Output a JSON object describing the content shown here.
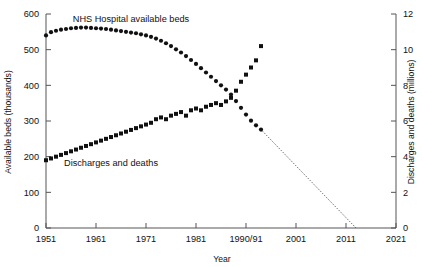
{
  "chart_data": {
    "type": "scatter",
    "title": "",
    "xlabel": "Year",
    "ylabel": "Available beds (thousands)",
    "y2label": "Discharges and deaths (millions)",
    "grid": false,
    "legend_position": "inline-annotations",
    "xlim": [
      1951,
      2021
    ],
    "ylim": [
      0,
      600
    ],
    "y2lim": [
      0,
      12
    ],
    "xticks": [
      1951,
      1961,
      1971,
      1981,
      1991,
      2001,
      2011,
      2021
    ],
    "xticklabels": [
      "1951",
      "1961",
      "1971",
      "1981",
      "1990/91",
      "2001",
      "2011",
      "2021"
    ],
    "yticks": [
      0,
      100,
      200,
      300,
      400,
      500,
      600
    ],
    "yticklabels": [
      "0",
      "100",
      "200",
      "300",
      "400",
      "500",
      "600"
    ],
    "y2ticks": [
      0,
      2,
      4,
      6,
      8,
      10,
      12
    ],
    "y2ticklabels": [
      "0",
      "2",
      "4",
      "6",
      "8",
      "10",
      "12"
    ],
    "annotations": [
      {
        "text": "NHS Hospital available beds",
        "x": 1968,
        "y": 585,
        "axis": "left"
      },
      {
        "text": "Discharges and deaths",
        "x": 1964,
        "y": 182,
        "axis": "left"
      }
    ],
    "series": [
      {
        "name": "NHS Hospital available beds",
        "axis": "left",
        "units": "thousands",
        "marker": "circle",
        "x": [
          1951,
          1952,
          1953,
          1954,
          1955,
          1956,
          1957,
          1958,
          1959,
          1960,
          1961,
          1962,
          1963,
          1964,
          1965,
          1966,
          1967,
          1968,
          1969,
          1970,
          1971,
          1972,
          1973,
          1974,
          1975,
          1976,
          1977,
          1978,
          1979,
          1980,
          1981,
          1982,
          1983,
          1984,
          1985,
          1986,
          1987,
          1988,
          1989,
          1990,
          1991,
          1992,
          1993,
          1994
        ],
        "y": [
          540,
          549,
          553,
          556,
          558,
          560,
          561,
          562,
          562,
          561,
          560,
          559,
          558,
          556,
          554,
          552,
          550,
          548,
          546,
          543,
          540,
          536,
          531,
          525,
          518,
          510,
          501,
          492,
          482,
          471,
          460,
          448,
          436,
          424,
          412,
          400,
          388,
          374,
          356,
          337,
          318,
          301,
          288,
          276
        ]
      },
      {
        "name": "Discharges and deaths",
        "axis": "right",
        "units": "millions",
        "marker": "square",
        "x": [
          1951,
          1952,
          1953,
          1954,
          1955,
          1956,
          1957,
          1958,
          1959,
          1960,
          1961,
          1962,
          1963,
          1964,
          1965,
          1966,
          1967,
          1968,
          1969,
          1970,
          1971,
          1972,
          1973,
          1974,
          1975,
          1976,
          1977,
          1978,
          1979,
          1980,
          1981,
          1982,
          1983,
          1984,
          1985,
          1986,
          1987,
          1988,
          1989,
          1990,
          1991,
          1992,
          1993,
          1994
        ],
        "y": [
          3.8,
          3.9,
          4.0,
          4.1,
          4.2,
          4.3,
          4.4,
          4.5,
          4.6,
          4.7,
          4.8,
          4.9,
          5.0,
          5.1,
          5.2,
          5.3,
          5.4,
          5.5,
          5.6,
          5.7,
          5.8,
          5.9,
          6.1,
          6.2,
          6.1,
          6.3,
          6.4,
          6.5,
          6.3,
          6.6,
          6.7,
          6.6,
          6.8,
          6.9,
          7.0,
          6.9,
          7.1,
          7.3,
          7.7,
          8.2,
          8.6,
          9.0,
          9.4,
          10.2
        ]
      },
      {
        "name": "Projection of available beds to zero",
        "axis": "left",
        "units": "thousands",
        "marker": "none",
        "linestyle": "dotted",
        "x": [
          1994,
          2013
        ],
        "y": [
          276,
          0
        ]
      }
    ]
  },
  "colors": {
    "marker": "#111111",
    "axis": "#555555",
    "text": "#111111",
    "background": "#ffffff"
  }
}
